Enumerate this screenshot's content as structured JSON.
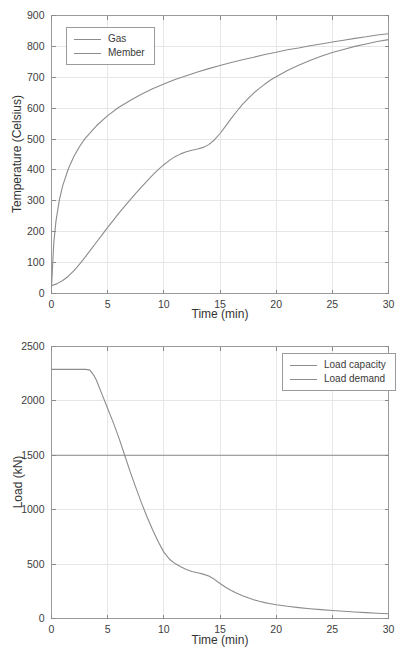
{
  "page": {
    "background": "#ffffff"
  },
  "colors": {
    "grid": "#e6e6e6",
    "axis_box": "#9b9b9b",
    "tick_mark": "#8a8a8a",
    "tick_label": "#404040",
    "axis_label": "#333333",
    "curve": "#8c8c8c"
  },
  "chart_data": [
    {
      "type": "line",
      "title": "",
      "xlabel": "Time (min)",
      "ylabel": "Temperature (Celsius)",
      "xlim": [
        0,
        30
      ],
      "ylim": [
        0,
        900
      ],
      "xticks": [
        0,
        5,
        10,
        15,
        20,
        25,
        30
      ],
      "yticks": [
        0,
        100,
        200,
        300,
        400,
        500,
        600,
        700,
        800,
        900
      ],
      "grid": true,
      "legend": {
        "position": "top-left",
        "entries": [
          "Gas",
          "Member"
        ]
      },
      "series": [
        {
          "name": "Gas",
          "color": "#8c8c8c",
          "x": [
            0,
            0.2,
            0.4,
            0.7,
            1,
            1.5,
            2,
            2.5,
            3,
            4,
            5,
            6,
            7,
            8,
            9,
            10,
            11,
            12,
            13,
            14,
            15,
            16,
            17,
            18,
            19,
            20,
            21,
            22,
            23,
            24,
            25,
            26,
            27,
            28,
            29,
            30
          ],
          "y": [
            20,
            163,
            235,
            303,
            349,
            404,
            444,
            476,
            502,
            543,
            576,
            603,
            625,
            645,
            663,
            678,
            693,
            705,
            717,
            728,
            738,
            748,
            757,
            765,
            774,
            781,
            789,
            795,
            802,
            808,
            814,
            820,
            826,
            831,
            837,
            841
          ]
        },
        {
          "name": "Member",
          "color": "#8c8c8c",
          "x": [
            0,
            0.5,
            1,
            1.5,
            2,
            2.5,
            3,
            3.5,
            4,
            4.5,
            5,
            5.5,
            6,
            6.5,
            7,
            7.5,
            8,
            8.5,
            9,
            9.5,
            10,
            10.5,
            11,
            11.5,
            12,
            12.5,
            13,
            13.5,
            14,
            14.5,
            15,
            15.5,
            16,
            16.5,
            17,
            17.5,
            18,
            18.5,
            19,
            19.5,
            20,
            21,
            22,
            23,
            24,
            25,
            26,
            27,
            28,
            29,
            30
          ],
          "y": [
            25,
            32,
            42,
            56,
            74,
            95,
            118,
            142,
            166,
            190,
            214,
            237,
            260,
            282,
            303,
            324,
            344,
            364,
            383,
            401,
            417,
            431,
            443,
            452,
            459,
            464,
            468,
            473,
            482,
            497,
            518,
            542,
            567,
            590,
            612,
            631,
            649,
            664,
            678,
            691,
            702,
            722,
            739,
            754,
            768,
            780,
            790,
            800,
            808,
            816,
            822
          ]
        }
      ]
    },
    {
      "type": "line",
      "title": "",
      "xlabel": "Time (min)",
      "ylabel": "Load (kN)",
      "xlim": [
        0,
        30
      ],
      "ylim": [
        0,
        2500
      ],
      "xticks": [
        0,
        5,
        10,
        15,
        20,
        25,
        30
      ],
      "yticks": [
        0,
        500,
        1000,
        1500,
        2000,
        2500
      ],
      "grid": true,
      "legend": {
        "position": "top-right",
        "entries": [
          "Load capacity",
          "Load demand"
        ]
      },
      "series": [
        {
          "name": "Load capacity",
          "color": "#8c8c8c",
          "x": [
            0,
            0.5,
            1,
            1.5,
            2,
            2.5,
            3,
            3.4,
            3.8,
            4,
            4.5,
            5,
            5.5,
            6,
            6.5,
            7,
            7.5,
            8,
            8.5,
            9,
            9.5,
            10,
            10.5,
            11,
            11.5,
            12,
            12.5,
            13,
            13.5,
            14,
            14.5,
            15,
            15.5,
            16,
            16.5,
            17,
            17.5,
            18,
            18.5,
            19,
            19.5,
            20,
            21,
            22,
            23,
            24,
            25,
            26,
            27,
            28,
            29,
            30
          ],
          "y": [
            2290,
            2290,
            2290,
            2290,
            2290,
            2290,
            2290,
            2285,
            2230,
            2190,
            2060,
            1930,
            1800,
            1660,
            1505,
            1350,
            1205,
            1065,
            935,
            815,
            705,
            610,
            545,
            505,
            475,
            450,
            432,
            420,
            408,
            390,
            360,
            322,
            288,
            258,
            232,
            210,
            190,
            172,
            158,
            146,
            136,
            127,
            112,
            100,
            90,
            82,
            74,
            67,
            60,
            54,
            48,
            43
          ]
        },
        {
          "name": "Load demand",
          "color": "#8c8c8c",
          "x": [
            0,
            30
          ],
          "y": [
            1500,
            1500
          ]
        }
      ]
    }
  ]
}
